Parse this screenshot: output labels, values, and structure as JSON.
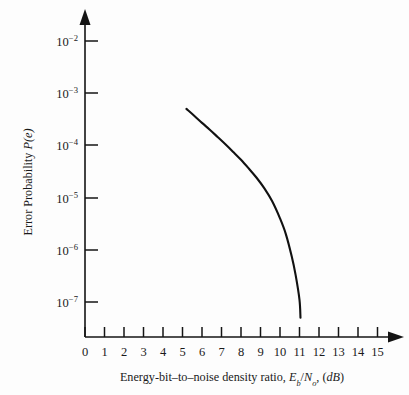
{
  "figure": {
    "background_color": "#fdfdfd",
    "ink_color": "#141414"
  },
  "chart_data": {
    "type": "line",
    "title": "",
    "subtitle": "",
    "xlabel": "Energy-bit–to–noise density ratio, Eb/No, (dB)",
    "xlabel_parts": {
      "lead": "Energy-bit–to–noise density ratio, ",
      "e_symbol": "E",
      "e_sub": "b",
      "slash": "/",
      "n_symbol": "N",
      "n_sub": "o",
      "trail": ", (",
      "unit": "dB",
      "close": ")"
    },
    "ylabel": "Error Probability P(e)",
    "ylabel_parts": {
      "lead": "Error Probability ",
      "symbol": "P(e)"
    },
    "xlim": [
      0,
      15
    ],
    "ylim": [
      1e-07,
      0.01
    ],
    "yscale": "log",
    "xscale": "linear",
    "grid": false,
    "legend": false,
    "legend_position": "none",
    "x_ticks": [
      0,
      1,
      2,
      3,
      4,
      5,
      6,
      7,
      8,
      9,
      10,
      11,
      12,
      13,
      14,
      15
    ],
    "x_tick_labels": [
      "0",
      "1",
      "2",
      "3",
      "4",
      "5",
      "6",
      "7",
      "8",
      "9",
      "10",
      "11",
      "12",
      "13",
      "14",
      "15"
    ],
    "y_ticks": [
      0.01,
      0.001,
      0.0001,
      1e-05,
      1e-06,
      1e-07
    ],
    "y_tick_labels": [
      {
        "mantissa": "10",
        "exponent": "−2"
      },
      {
        "mantissa": "10",
        "exponent": "−3"
      },
      {
        "mantissa": "10",
        "exponent": "−4"
      },
      {
        "mantissa": "10",
        "exponent": "−5"
      },
      {
        "mantissa": "10",
        "exponent": "−6"
      },
      {
        "mantissa": "10",
        "exponent": "−7"
      }
    ],
    "series": [
      {
        "name": "Bit error probability",
        "color": "#111111",
        "x": [
          5.2,
          5.6,
          6.0,
          6.4,
          6.8,
          7.2,
          7.6,
          8.0,
          8.4,
          8.8,
          9.2,
          9.6,
          10.0,
          10.3,
          10.6,
          10.8,
          11.0,
          11.05
        ],
        "y": [
          0.0005,
          0.00037,
          0.00027,
          0.0002,
          0.000145,
          0.000105,
          7.5e-05,
          5.3e-05,
          3.6e-05,
          2.4e-05,
          1.5e-05,
          8.5e-06,
          4e-06,
          2e-06,
          7.5e-07,
          3.3e-07,
          1.1e-07,
          5e-08
        ]
      }
    ],
    "annotations": [],
    "axis_style": {
      "axis_arrows": true,
      "spines": [
        "left",
        "bottom"
      ],
      "tick_direction": "out"
    }
  }
}
